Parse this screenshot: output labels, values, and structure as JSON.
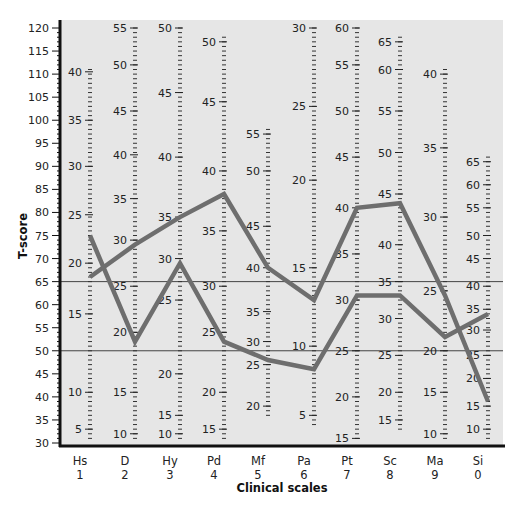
{
  "chart_data": {
    "type": "line",
    "title": "",
    "xlabel": "Clinical scales",
    "ylabel": "T-score",
    "ylim": [
      30,
      120
    ],
    "yticks": [
      30,
      35,
      40,
      45,
      50,
      55,
      60,
      65,
      70,
      75,
      80,
      85,
      90,
      95,
      100,
      105,
      110,
      115,
      120
    ],
    "reference_lines": [
      65,
      50
    ],
    "categories": [
      "Hs",
      "D",
      "Hy",
      "Pd",
      "Mf",
      "Pa",
      "Pt",
      "Sc",
      "Ma",
      "Si"
    ],
    "category_numbers": [
      "1",
      "2",
      "3",
      "4",
      "5",
      "6",
      "7",
      "8",
      "9",
      "0"
    ],
    "series": [
      {
        "name": "Profile A",
        "values": [
          66,
          73,
          79,
          84,
          68,
          61,
          81,
          82,
          62,
          39
        ]
      },
      {
        "name": "Profile B",
        "values": [
          75,
          52,
          69,
          52,
          48,
          46,
          62,
          62,
          53,
          58
        ]
      }
    ],
    "raw_score_columns": [
      {
        "scale": "Hs",
        "labels": [
          {
            "v": "40",
            "t": 110.5
          },
          {
            "v": "35",
            "t": 100
          },
          {
            "v": "30",
            "t": 90
          },
          {
            "v": "25",
            "t": 79.5
          },
          {
            "v": "20",
            "t": 69
          },
          {
            "v": "15",
            "t": 58
          },
          {
            "v": "10",
            "t": 41
          },
          {
            "v": "5",
            "t": 33
          }
        ]
      },
      {
        "scale": "D",
        "labels": [
          {
            "v": "55",
            "t": 120
          },
          {
            "v": "50",
            "t": 112
          },
          {
            "v": "45",
            "t": 102
          },
          {
            "v": "40",
            "t": 92.5
          },
          {
            "v": "35",
            "t": 83
          },
          {
            "v": "30",
            "t": 74
          },
          {
            "v": "25",
            "t": 64
          },
          {
            "v": "20",
            "t": 54
          },
          {
            "v": "15",
            "t": 41
          },
          {
            "v": "10",
            "t": 32
          }
        ]
      },
      {
        "scale": "Hy",
        "labels": [
          {
            "v": "50",
            "t": 120
          },
          {
            "v": "45",
            "t": 106
          },
          {
            "v": "40",
            "t": 92
          },
          {
            "v": "35",
            "t": 79
          },
          {
            "v": "30",
            "t": 70
          },
          {
            "v": "25",
            "t": 61
          },
          {
            "v": "20",
            "t": 45
          },
          {
            "v": "15",
            "t": 36
          },
          {
            "v": "10",
            "t": 32
          }
        ]
      },
      {
        "scale": "Pd",
        "labels": [
          {
            "v": "50",
            "t": 117
          },
          {
            "v": "45",
            "t": 104
          },
          {
            "v": "40",
            "t": 89
          },
          {
            "v": "35",
            "t": 76
          },
          {
            "v": "30",
            "t": 64
          },
          {
            "v": "25",
            "t": 54
          },
          {
            "v": "20",
            "t": 41
          },
          {
            "v": "15",
            "t": 33
          }
        ]
      },
      {
        "scale": "Mf",
        "labels": [
          {
            "v": "55",
            "t": 97
          },
          {
            "v": "50",
            "t": 89
          },
          {
            "v": "45",
            "t": 77
          },
          {
            "v": "40",
            "t": 68
          },
          {
            "v": "35",
            "t": 58.5
          },
          {
            "v": "30",
            "t": 52
          },
          {
            "v": "25",
            "t": 47
          },
          {
            "v": "20",
            "t": 38
          }
        ]
      },
      {
        "scale": "Pa",
        "labels": [
          {
            "v": "30",
            "t": 120
          },
          {
            "v": "25",
            "t": 103
          },
          {
            "v": "20",
            "t": 87
          },
          {
            "v": "15",
            "t": 68
          },
          {
            "v": "10",
            "t": 51
          },
          {
            "v": "5",
            "t": 36
          }
        ]
      },
      {
        "scale": "Pt",
        "labels": [
          {
            "v": "60",
            "t": 120
          },
          {
            "v": "55",
            "t": 112
          },
          {
            "v": "50",
            "t": 102
          },
          {
            "v": "45",
            "t": 92
          },
          {
            "v": "40",
            "t": 81
          },
          {
            "v": "35",
            "t": 71
          },
          {
            "v": "30",
            "t": 61
          },
          {
            "v": "25",
            "t": 50
          },
          {
            "v": "20",
            "t": 40
          },
          {
            "v": "15",
            "t": 31
          }
        ]
      },
      {
        "scale": "Sc",
        "labels": [
          {
            "v": "65",
            "t": 117
          },
          {
            "v": "60",
            "t": 111
          },
          {
            "v": "55",
            "t": 102
          },
          {
            "v": "50",
            "t": 93
          },
          {
            "v": "45",
            "t": 84
          },
          {
            "v": "40",
            "t": 73
          },
          {
            "v": "35",
            "t": 65
          },
          {
            "v": "30",
            "t": 57
          },
          {
            "v": "25",
            "t": 49
          },
          {
            "v": "20",
            "t": 41
          },
          {
            "v": "15",
            "t": 35
          }
        ]
      },
      {
        "scale": "Ma",
        "labels": [
          {
            "v": "40",
            "t": 110
          },
          {
            "v": "35",
            "t": 94
          },
          {
            "v": "30",
            "t": 79
          },
          {
            "v": "25",
            "t": 63
          },
          {
            "v": "20",
            "t": 50
          },
          {
            "v": "15",
            "t": 41
          },
          {
            "v": "10",
            "t": 32
          }
        ]
      },
      {
        "scale": "Si",
        "labels": [
          {
            "v": "65",
            "t": 91
          },
          {
            "v": "60",
            "t": 86
          },
          {
            "v": "55",
            "t": 81
          },
          {
            "v": "50",
            "t": 75
          },
          {
            "v": "45",
            "t": 70
          },
          {
            "v": "40",
            "t": 64
          },
          {
            "v": "35",
            "t": 59
          },
          {
            "v": "30",
            "t": 54.5
          },
          {
            "v": "25",
            "t": 49
          },
          {
            "v": "20",
            "t": 44
          },
          {
            "v": "15",
            "t": 38
          },
          {
            "v": "10",
            "t": 33
          }
        ]
      }
    ],
    "grid": false,
    "legend": "none"
  },
  "colors": {
    "plot_background": "#e6e6e6",
    "line": "#6e6e6e",
    "axis": "#111111",
    "reference_line": "#444444"
  }
}
